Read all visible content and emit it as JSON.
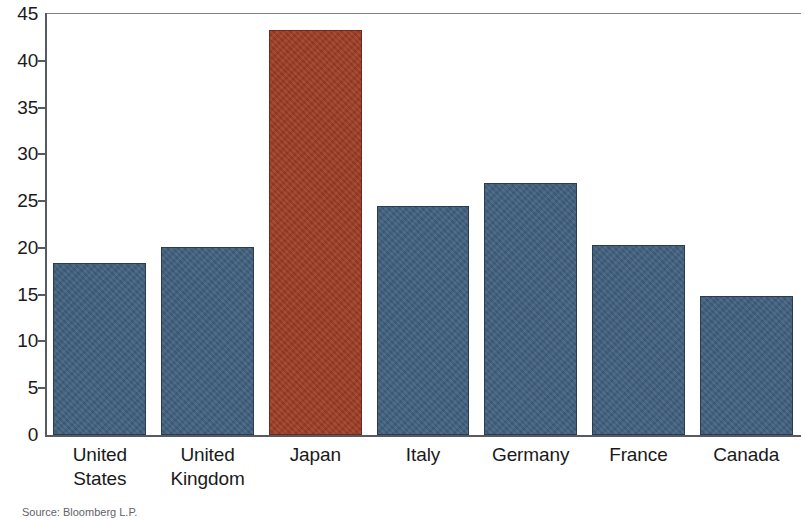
{
  "chart_data": {
    "type": "bar",
    "title": "",
    "subtitle": "",
    "xlabel": "",
    "ylabel": "",
    "categories": [
      "United States",
      "United Kingdom",
      "Japan",
      "Italy",
      "Germany",
      "France",
      "Canada"
    ],
    "category_lines": [
      [
        "United",
        "States"
      ],
      [
        "United",
        "Kingdom"
      ],
      [
        "Japan",
        ""
      ],
      [
        "Italy",
        ""
      ],
      [
        "Germany",
        ""
      ],
      [
        "France",
        ""
      ],
      [
        "Canada",
        ""
      ]
    ],
    "values": [
      18.4,
      20.1,
      43.3,
      24.5,
      26.9,
      20.3,
      14.9
    ],
    "bar_colors": [
      "#41607f",
      "#41607f",
      "#9e3c25",
      "#41607f",
      "#41607f",
      "#41607f",
      "#41607f"
    ],
    "highlight_category": "Japan",
    "ylim": [
      0,
      45
    ],
    "ytick_values": [
      0,
      5,
      10,
      15,
      20,
      25,
      30,
      35,
      40,
      45
    ],
    "ytick_labels": [
      "0",
      "5",
      "10",
      "15",
      "20",
      "25",
      "30",
      "35",
      "40",
      "45"
    ],
    "grid": false,
    "legend": false,
    "legend_position": "none",
    "accent_color": "#9e3c25",
    "series_color": "#41607f",
    "axis_color": "#555b60"
  },
  "footer": {
    "source_note": "Source: Bloomberg L.P."
  }
}
